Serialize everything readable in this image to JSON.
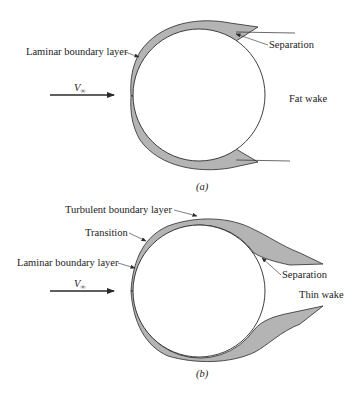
{
  "figure_a": {
    "caption": "(a)",
    "labels": {
      "laminar": "Laminar boundary layer",
      "separation": "Separation",
      "wake": "Fat wake",
      "velocity": "V",
      "velocity_sub": "∞"
    }
  },
  "figure_b": {
    "caption": "(b)",
    "labels": {
      "turbulent": "Turbulent boundary layer",
      "transition": "Transition",
      "laminar": "Laminar boundary layer",
      "separation": "Separation",
      "wake": "Thin wake",
      "velocity": "V",
      "velocity_sub": "∞"
    }
  },
  "colors": {
    "line": "#2a2a2a",
    "layer_fill": "#b4b4b4"
  }
}
